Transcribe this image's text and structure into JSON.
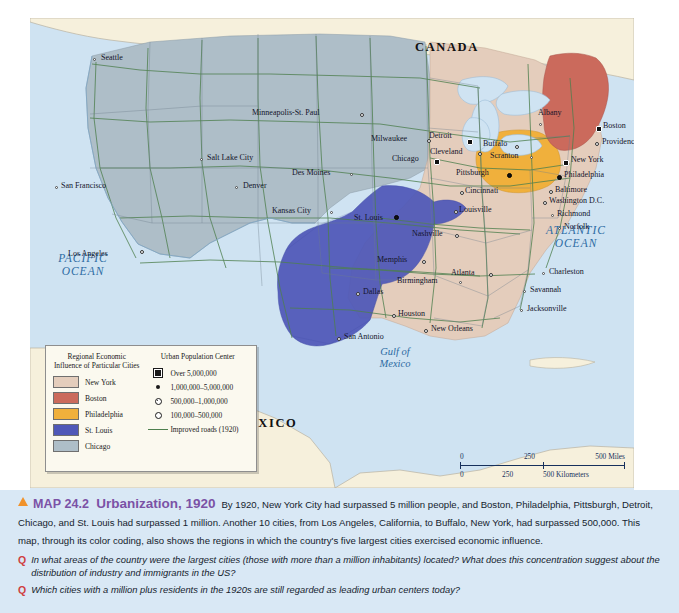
{
  "map": {
    "countries": [
      {
        "name": "CANADA",
        "x": 415,
        "y": 28
      },
      {
        "name": "MEXICO",
        "x": 235,
        "y": 408
      }
    ],
    "oceans": [
      {
        "name": "PACIFIC OCEAN",
        "x": 28,
        "y": 238
      },
      {
        "name": "ATLANTIC OCEAN",
        "x": 510,
        "y": 210
      }
    ],
    "gulf": {
      "name": "Gulf of Mexico",
      "x": 352,
      "y": 335
    },
    "cities": [
      {
        "name": "Seattle",
        "x": 63,
        "y": 40,
        "size": "sm",
        "dx": 8,
        "dy": 0
      },
      {
        "name": "San Francisco",
        "x": 25,
        "y": 168,
        "size": "sm",
        "dx": 6,
        "dy": 0
      },
      {
        "name": "Los Angeles",
        "x": 110,
        "y": 232,
        "size": "md",
        "dx": -72,
        "dy": 4
      },
      {
        "name": "Salt Lake City",
        "x": 170,
        "y": 140,
        "size": "sm",
        "dx": 7,
        "dy": 0
      },
      {
        "name": "Denver",
        "x": 205,
        "y": 168,
        "size": "sm",
        "dx": 8,
        "dy": 0
      },
      {
        "name": "Minneapolis-St. Paul",
        "x": 330,
        "y": 95,
        "size": "md",
        "dx": -108,
        "dy": 0
      },
      {
        "name": "Des Moines",
        "x": 320,
        "y": 155,
        "size": "sm",
        "dx": -58,
        "dy": 0
      },
      {
        "name": "Kansas City",
        "x": 300,
        "y": 193,
        "size": "sm",
        "dx": -58,
        "dy": 0
      },
      {
        "name": "Milwaukee",
        "x": 397,
        "y": 121,
        "size": "md",
        "dx": -56,
        "dy": 0
      },
      {
        "name": "Chicago",
        "x": 404,
        "y": 141,
        "size": "xl",
        "dx": -42,
        "dy": 0
      },
      {
        "name": "St. Louis",
        "x": 364,
        "y": 197,
        "size": "lg",
        "dx": -40,
        "dy": 3
      },
      {
        "name": "Detroit",
        "x": 437,
        "y": 121,
        "size": "xl",
        "dx": -38,
        "dy": -3
      },
      {
        "name": "Cleveland",
        "x": 448,
        "y": 134,
        "size": "md",
        "dx": -48,
        "dy": 0
      },
      {
        "name": "Cincinnati",
        "x": 430,
        "y": 173,
        "size": "md",
        "dx": 5,
        "dy": 0
      },
      {
        "name": "Louisville",
        "x": 424,
        "y": 192,
        "size": "md",
        "dx": 5,
        "dy": 0
      },
      {
        "name": "Nashville",
        "x": 425,
        "y": 216,
        "size": "md",
        "dx": -43,
        "dy": 0
      },
      {
        "name": "Memphis",
        "x": 392,
        "y": 242,
        "size": "md",
        "dx": -45,
        "dy": 0
      },
      {
        "name": "Birmingham",
        "x": 429,
        "y": 263,
        "size": "sm",
        "dx": -62,
        "dy": 0
      },
      {
        "name": "Atlanta",
        "x": 459,
        "y": 255,
        "size": "md",
        "dx": -38,
        "dy": 0
      },
      {
        "name": "Charleston",
        "x": 512,
        "y": 254,
        "size": "sm",
        "dx": 7,
        "dy": 0
      },
      {
        "name": "Savannah",
        "x": 493,
        "y": 272,
        "size": "sm",
        "dx": 7,
        "dy": 0
      },
      {
        "name": "Jacksonville",
        "x": 490,
        "y": 291,
        "size": "sm",
        "dx": 7,
        "dy": 0
      },
      {
        "name": "New Orleans",
        "x": 394,
        "y": 311,
        "size": "md",
        "dx": 7,
        "dy": 0
      },
      {
        "name": "Houston",
        "x": 362,
        "y": 296,
        "size": "md",
        "dx": 6,
        "dy": 0
      },
      {
        "name": "San Antonio",
        "x": 307,
        "y": 319,
        "size": "md",
        "dx": 7,
        "dy": 0
      },
      {
        "name": "Dallas",
        "x": 326,
        "y": 274,
        "size": "md",
        "dx": 7,
        "dy": 0
      },
      {
        "name": "Albany",
        "x": 509,
        "y": 105,
        "size": "sm",
        "dx": -1,
        "dy": -10
      },
      {
        "name": "Boston",
        "x": 566,
        "y": 108,
        "size": "xl",
        "dx": 7,
        "dy": 0
      },
      {
        "name": "Providence",
        "x": 565,
        "y": 124,
        "size": "md",
        "dx": 7,
        "dy": 0
      },
      {
        "name": "Buffalo",
        "x": 485,
        "y": 127,
        "size": "md",
        "dx": -32,
        "dy": -1
      },
      {
        "name": "Scranton",
        "x": 500,
        "y": 138,
        "size": "sm",
        "dx": -40,
        "dy": 0
      },
      {
        "name": "New York",
        "x": 533,
        "y": 142,
        "size": "xl",
        "dx": 8,
        "dy": 0
      },
      {
        "name": "Pittsburgh",
        "x": 477,
        "y": 155,
        "size": "lg",
        "dx": -51,
        "dy": 0
      },
      {
        "name": "Philadelphia",
        "x": 527,
        "y": 157,
        "size": "lg",
        "dx": 7,
        "dy": 0
      },
      {
        "name": "Baltimore",
        "x": 519,
        "y": 172,
        "size": "md",
        "dx": 6,
        "dy": 0
      },
      {
        "name": "Washington D.C.",
        "x": 513,
        "y": 183,
        "size": "md",
        "dx": 6,
        "dy": 0
      },
      {
        "name": "Richmond",
        "x": 521,
        "y": 196,
        "size": "sm",
        "dx": 6,
        "dy": 0
      },
      {
        "name": "Norfolk",
        "x": 528,
        "y": 209,
        "size": "sm",
        "dx": 6,
        "dy": 0
      }
    ]
  },
  "legend": {
    "title_left": "Regional Economic Influence of Particular Cities",
    "title_right": "Urban Population Center",
    "regions": [
      {
        "label": "New York",
        "color": "#e4cdbc"
      },
      {
        "label": "Boston",
        "color": "#cb6a5c"
      },
      {
        "label": "Philadelphia",
        "color": "#f0b03c"
      },
      {
        "label": "St. Louis",
        "color": "#4f58b8"
      },
      {
        "label": "Chicago",
        "color": "#aebec8"
      }
    ],
    "population": [
      {
        "label": "Over 5,000,000",
        "symbol": "square-filled-icon"
      },
      {
        "label": "1,000,000–5,000,000",
        "symbol": "dot-filled-icon"
      },
      {
        "label": "500,000–1,000,000",
        "symbol": "dot-half-icon"
      },
      {
        "label": "100,000–500,000",
        "symbol": "dot-open-icon"
      }
    ],
    "roads": {
      "label": "Improved roads (1920)",
      "color": "#4e7f4e"
    }
  },
  "scale": {
    "miles": [
      "0",
      "250",
      "500 Miles"
    ],
    "km": [
      "0",
      "250",
      "500 Kilometers"
    ]
  },
  "caption": {
    "map_number": "MAP 24.2",
    "title": "Urbanization, 1920",
    "body": "By 1920, New York City had surpassed 5 million people, and Boston, Philadelphia, Pittsburgh, Detroit, Chicago, and St. Louis had surpassed 1 million. Another 10 cities, from Los Angeles, California, to Buffalo, New York, had surpassed 500,000. This map, through its color coding, also shows the regions in which the country's five largest cities exercised economic influence.",
    "questions": [
      {
        "marker": "Q",
        "text": "In what areas of the country were the largest cities (those with more than a million inhabitants) located? What does this concentration suggest about the distribution of industry and immigrants in the US?"
      },
      {
        "marker": "Q",
        "text": "Which cities with a million plus residents in the 1920s are still regarded as leading urban centers today?"
      }
    ]
  }
}
